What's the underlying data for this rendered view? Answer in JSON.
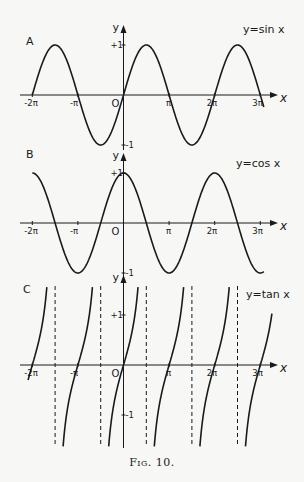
{
  "figure": {
    "caption": "Fig. 10."
  },
  "chart_data": [
    {
      "type": "line",
      "panel": "A",
      "title": "y=sin x",
      "function": "sin",
      "xlabel": "x",
      "ylabel": "y",
      "origin_label": "O",
      "x_ticks": [
        {
          "value": -6.2832,
          "label": "-2π"
        },
        {
          "value": -3.1416,
          "label": "-π"
        },
        {
          "value": 3.1416,
          "label": "π"
        },
        {
          "value": 6.2832,
          "label": "2π"
        },
        {
          "value": 9.4248,
          "label": "3π"
        }
      ],
      "y_ticks": [
        {
          "value": 1,
          "label": "+1"
        },
        {
          "value": -1,
          "label": "-1"
        }
      ],
      "xlim": [
        -6.9,
        9.9
      ],
      "ylim": [
        -1.1,
        1.1
      ],
      "x_range_plotted": [
        -6.2832,
        9.7
      ],
      "sample_points": [
        {
          "x": -6.2832,
          "y": 0
        },
        {
          "x": -4.7124,
          "y": 1
        },
        {
          "x": -3.1416,
          "y": 0
        },
        {
          "x": -1.5708,
          "y": -1
        },
        {
          "x": 0,
          "y": 0
        },
        {
          "x": 1.5708,
          "y": 1
        },
        {
          "x": 3.1416,
          "y": 0
        },
        {
          "x": 4.7124,
          "y": -1
        },
        {
          "x": 6.2832,
          "y": 0
        },
        {
          "x": 7.854,
          "y": 1
        },
        {
          "x": 9.4248,
          "y": 0
        }
      ],
      "grid": false
    },
    {
      "type": "line",
      "panel": "B",
      "title": "y=cos x",
      "function": "cos",
      "xlabel": "x",
      "ylabel": "y",
      "origin_label": "O",
      "x_ticks": [
        {
          "value": -6.2832,
          "label": "-2π"
        },
        {
          "value": -3.1416,
          "label": "-π"
        },
        {
          "value": 3.1416,
          "label": "π"
        },
        {
          "value": 6.2832,
          "label": "2π"
        },
        {
          "value": 9.4248,
          "label": "3π"
        }
      ],
      "y_ticks": [
        {
          "value": 1,
          "label": "+1"
        },
        {
          "value": -1,
          "label": "-1"
        }
      ],
      "xlim": [
        -6.9,
        9.9
      ],
      "ylim": [
        -1.1,
        1.1
      ],
      "x_range_plotted": [
        -6.2832,
        9.7
      ],
      "sample_points": [
        {
          "x": -6.2832,
          "y": 1
        },
        {
          "x": -4.7124,
          "y": 0
        },
        {
          "x": -3.1416,
          "y": -1
        },
        {
          "x": -1.5708,
          "y": 0
        },
        {
          "x": 0,
          "y": 1
        },
        {
          "x": 1.5708,
          "y": 0
        },
        {
          "x": 3.1416,
          "y": -1
        },
        {
          "x": 4.7124,
          "y": 0
        },
        {
          "x": 6.2832,
          "y": 1
        },
        {
          "x": 7.854,
          "y": 0
        },
        {
          "x": 9.4248,
          "y": -1
        }
      ],
      "grid": false
    },
    {
      "type": "line",
      "panel": "C",
      "title": "y=tan x",
      "function": "tan",
      "xlabel": "x",
      "ylabel": "y",
      "origin_label": "O",
      "x_ticks": [
        {
          "value": -6.2832,
          "label": "-2π"
        },
        {
          "value": -3.1416,
          "label": "-π"
        },
        {
          "value": 3.1416,
          "label": "π"
        },
        {
          "value": 6.2832,
          "label": "2π"
        },
        {
          "value": 9.4248,
          "label": "3π"
        }
      ],
      "y_ticks": [
        {
          "value": 1,
          "label": "+1"
        },
        {
          "value": -1,
          "label": "-1"
        }
      ],
      "asymptotes": [
        -4.7124,
        -1.5708,
        1.5708,
        4.7124,
        7.854
      ],
      "asymptote_labels": [
        "-3π/2",
        "-π/2",
        "π/2",
        "3π/2",
        "5π/2"
      ],
      "xlim": [
        -6.9,
        9.9
      ],
      "ylim": [
        -1.6,
        1.6
      ],
      "sample_points": [
        {
          "x": -3.1416,
          "y": 0
        },
        {
          "x": -2.3562,
          "y": 1
        },
        {
          "x": -3.927,
          "y": -1
        },
        {
          "x": 0,
          "y": 0
        },
        {
          "x": 0.7854,
          "y": 1
        },
        {
          "x": -0.7854,
          "y": -1
        },
        {
          "x": 3.1416,
          "y": 0
        },
        {
          "x": 3.927,
          "y": 1
        },
        {
          "x": 2.3562,
          "y": -1
        },
        {
          "x": 6.2832,
          "y": 0
        },
        {
          "x": 7.0686,
          "y": 1
        },
        {
          "x": 5.4978,
          "y": -1
        }
      ],
      "grid": false
    }
  ]
}
